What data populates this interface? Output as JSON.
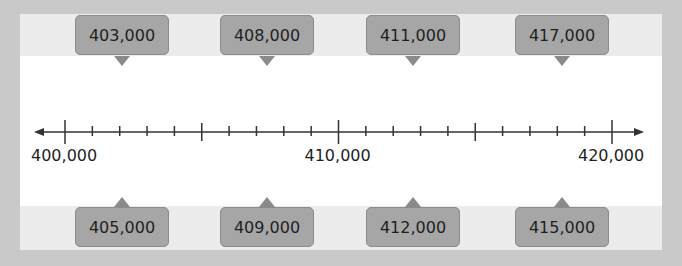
{
  "number_line": {
    "min": 400000,
    "max": 420000,
    "minor_step": 1000,
    "major_step": 5000,
    "tick_labels": [
      {
        "value": 400000,
        "label": "400,000"
      },
      {
        "value": 410000,
        "label": "410,000"
      },
      {
        "value": 420000,
        "label": "420,000"
      }
    ]
  },
  "top_cards": [
    {
      "value": 403000,
      "label": "403,000"
    },
    {
      "value": 408000,
      "label": "408,000"
    },
    {
      "value": 411000,
      "label": "411,000"
    },
    {
      "value": 417000,
      "label": "417,000"
    }
  ],
  "bottom_cards": [
    {
      "value": 405000,
      "label": "405,000"
    },
    {
      "value": 409000,
      "label": "409,000"
    },
    {
      "value": 412000,
      "label": "412,000"
    },
    {
      "value": 415000,
      "label": "415,000"
    }
  ],
  "colors": {
    "frame": "#c9c9c9",
    "band": "#ececec",
    "card": "#a6a6a6",
    "line": "#333333"
  }
}
